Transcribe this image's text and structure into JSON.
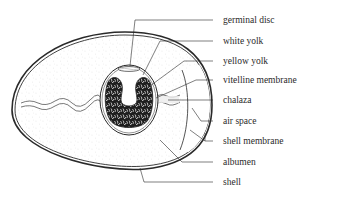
{
  "diagram": {
    "labels": [
      {
        "id": "germinal-disc",
        "text": "germinal disc",
        "y": 20
      },
      {
        "id": "white-yolk",
        "text": "white yolk",
        "y": 41
      },
      {
        "id": "yellow-yolk",
        "text": "yellow yolk",
        "y": 61
      },
      {
        "id": "vitelline-membrane",
        "text": "vitelline membrane",
        "y": 80
      },
      {
        "id": "chalaza",
        "text": "chalaza",
        "y": 100
      },
      {
        "id": "air-space",
        "text": "air space",
        "y": 121
      },
      {
        "id": "shell-membrane",
        "text": "shell membrane",
        "y": 141
      },
      {
        "id": "albumen",
        "text": "albumen",
        "y": 162
      },
      {
        "id": "shell",
        "text": "shell",
        "y": 182
      }
    ],
    "colors": {
      "line": "#2a2a2a",
      "yolk_dark": "#1e1e1e",
      "background": "#ffffff",
      "albumen_stipple": "#9a9a9a"
    }
  }
}
